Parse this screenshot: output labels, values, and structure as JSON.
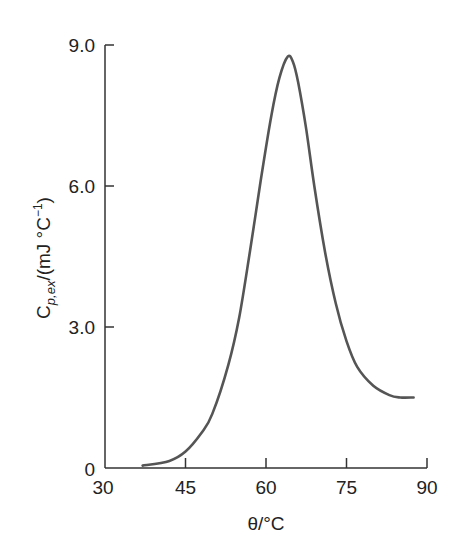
{
  "chart_data": {
    "type": "line",
    "title": "",
    "xlabel": "θ/°C",
    "ylabel": "C_{p,ex}/(mJ °C⁻¹)",
    "ylabel_parts": {
      "main": "C",
      "sub": "p,ex",
      "rest": "/(mJ °C",
      "sup": "−1",
      "close": ")"
    },
    "xlim": [
      30,
      90
    ],
    "ylim": [
      0,
      9
    ],
    "xticks": [
      30,
      45,
      60,
      75,
      90
    ],
    "xtick_labels": [
      "30",
      "45",
      "60",
      "75",
      "90"
    ],
    "yticks": [
      0,
      3,
      6,
      9
    ],
    "ytick_labels": [
      "0",
      "3.0",
      "6.0",
      "9.0"
    ],
    "grid": false,
    "legend": null,
    "series": [
      {
        "name": "excess heat capacity",
        "color": "#555555",
        "x": [
          37,
          42,
          45,
          48,
          50,
          53,
          55,
          57,
          59,
          61,
          62.5,
          64,
          65,
          66,
          67.5,
          69,
          71,
          73,
          75,
          77,
          80,
          83,
          85,
          87.5
        ],
        "y": [
          0.05,
          0.15,
          0.35,
          0.75,
          1.15,
          2.2,
          3.2,
          4.6,
          6.1,
          7.5,
          8.3,
          8.75,
          8.65,
          8.2,
          7.2,
          6.0,
          4.6,
          3.5,
          2.7,
          2.15,
          1.75,
          1.55,
          1.5,
          1.5
        ]
      }
    ],
    "annotations": {
      "peak": {
        "x": 64,
        "y": 8.75
      }
    }
  },
  "colors": {
    "axis": "#333333",
    "curve": "#555555",
    "text": "#222222"
  }
}
